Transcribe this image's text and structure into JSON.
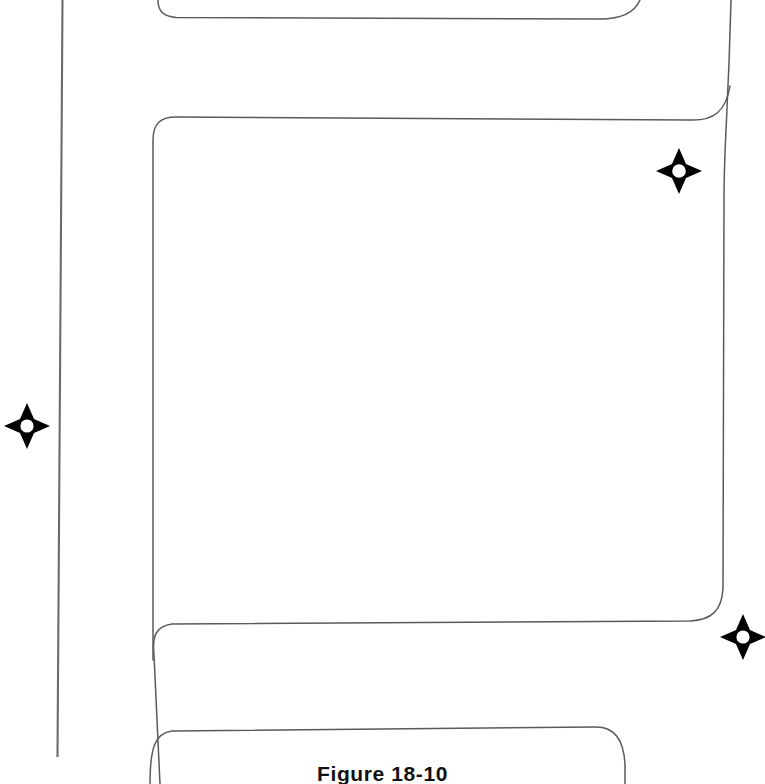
{
  "figure": {
    "caption": "Figure 18-10",
    "caption_label": "Figure 18-10",
    "background_color": "#ffffff",
    "line_color": "#5a5a5a",
    "marker_color": "#000000"
  },
  "drawing": {
    "type": "survey-site-plan",
    "description": "Street intersection curb return lines with survey monument markers",
    "lines": [
      {
        "name": "left-property-line",
        "kind": "property-line",
        "orientation": "vertical",
        "start": [
          62,
          0
        ],
        "end": [
          57,
          757
        ]
      },
      {
        "name": "upper-curb-return-north",
        "kind": "curb-line",
        "start": [
          158,
          0
        ],
        "end": [
          640,
          0
        ]
      },
      {
        "name": "upper-curb-return-south",
        "kind": "curb-line",
        "start": [
          160,
          784
        ],
        "end": [
          731,
          0
        ]
      },
      {
        "name": "lower-curb-return",
        "kind": "curb-line",
        "start": [
          150,
          784
        ],
        "end": [
          625,
          784
        ]
      }
    ],
    "markers": [
      {
        "name": "survey-monument-1",
        "label": "survey monument",
        "x": 679,
        "y": 173
      },
      {
        "name": "survey-monument-2",
        "label": "survey monument",
        "x": 27,
        "y": 427
      },
      {
        "name": "survey-monument-3",
        "label": "survey monument",
        "x": 743,
        "y": 638
      }
    ]
  }
}
